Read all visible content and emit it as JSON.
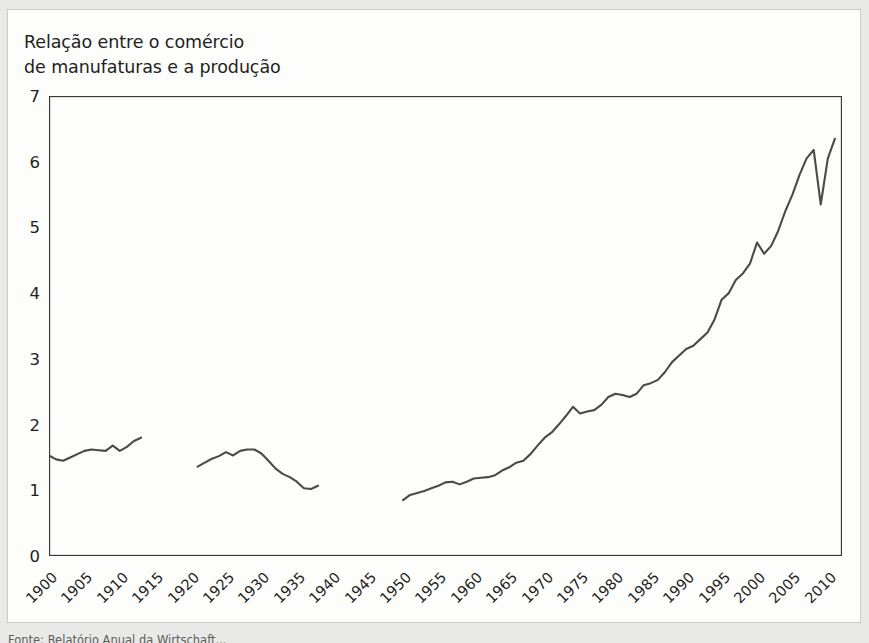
{
  "figure": {
    "title": "Relação entre o comércio\nde manufaturas e a produção",
    "source_note": "Fonte: Relatório Anual da Wirtschaft..."
  },
  "chart_data": {
    "type": "line",
    "title": "Relação entre o comércio de manufaturas e a produção",
    "xlabel": "",
    "ylabel": "",
    "xlim": [
      1900,
      2012
    ],
    "ylim": [
      0,
      7
    ],
    "grid": false,
    "legend": null,
    "line_color": "#4a4a48",
    "xticks": [
      1900,
      1905,
      1910,
      1915,
      1920,
      1925,
      1930,
      1935,
      1940,
      1945,
      1950,
      1955,
      1960,
      1965,
      1970,
      1975,
      1980,
      1985,
      1990,
      1995,
      2000,
      2005,
      2010
    ],
    "yticks": [
      0,
      1,
      2,
      3,
      4,
      5,
      6,
      7
    ],
    "series": [
      {
        "name": "1900-1913",
        "x": [
          1900,
          1901,
          1902,
          1903,
          1904,
          1905,
          1906,
          1907,
          1908,
          1909,
          1910,
          1911,
          1912,
          1913
        ],
        "values": [
          1.53,
          1.47,
          1.45,
          1.5,
          1.55,
          1.6,
          1.62,
          1.61,
          1.6,
          1.68,
          1.6,
          1.66,
          1.75,
          1.8
        ]
      },
      {
        "name": "1921-1938",
        "x": [
          1921,
          1922,
          1923,
          1924,
          1925,
          1926,
          1927,
          1928,
          1929,
          1930,
          1931,
          1932,
          1933,
          1934,
          1935,
          1936,
          1937,
          1938
        ],
        "values": [
          1.36,
          1.42,
          1.48,
          1.52,
          1.58,
          1.53,
          1.6,
          1.62,
          1.62,
          1.56,
          1.45,
          1.33,
          1.25,
          1.2,
          1.13,
          1.03,
          1.02,
          1.07
        ]
      },
      {
        "name": "1950-2011",
        "x": [
          1950,
          1951,
          1952,
          1953,
          1954,
          1955,
          1956,
          1957,
          1958,
          1959,
          1960,
          1961,
          1962,
          1963,
          1964,
          1965,
          1966,
          1967,
          1968,
          1969,
          1970,
          1971,
          1972,
          1973,
          1974,
          1975,
          1976,
          1977,
          1978,
          1979,
          1980,
          1981,
          1982,
          1983,
          1984,
          1985,
          1986,
          1987,
          1988,
          1989,
          1990,
          1991,
          1992,
          1993,
          1994,
          1995,
          1996,
          1997,
          1998,
          1999,
          2000,
          2001,
          2002,
          2003,
          2004,
          2005,
          2006,
          2007,
          2008,
          2009,
          2010,
          2011
        ],
        "values": [
          0.85,
          0.93,
          0.96,
          0.99,
          1.03,
          1.07,
          1.12,
          1.13,
          1.09,
          1.13,
          1.18,
          1.19,
          1.2,
          1.23,
          1.3,
          1.35,
          1.42,
          1.45,
          1.55,
          1.68,
          1.8,
          1.88,
          2.0,
          2.13,
          2.27,
          2.17,
          2.2,
          2.22,
          2.3,
          2.42,
          2.47,
          2.45,
          2.42,
          2.47,
          2.6,
          2.63,
          2.68,
          2.8,
          2.95,
          3.05,
          3.15,
          3.2,
          3.3,
          3.4,
          3.6,
          3.9,
          4.0,
          4.2,
          4.3,
          4.45,
          4.77,
          4.6,
          4.72,
          4.95,
          5.25,
          5.5,
          5.8,
          6.05,
          6.18,
          5.35,
          6.05,
          6.35
        ]
      }
    ]
  }
}
